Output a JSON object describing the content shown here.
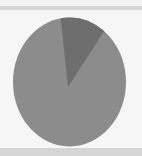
{
  "chart_data": {
    "type": "pie",
    "title": "",
    "labels": [
      "Slice A",
      "Slice B"
    ],
    "values": [
      13,
      87
    ],
    "colors": [
      "#6e6e6e",
      "#8c8c8c"
    ],
    "start_angle_deg": -9,
    "legend": "none",
    "data_labels": "none"
  },
  "colors": {
    "background": "#f6f6f6",
    "band": "#d6d6d6"
  }
}
